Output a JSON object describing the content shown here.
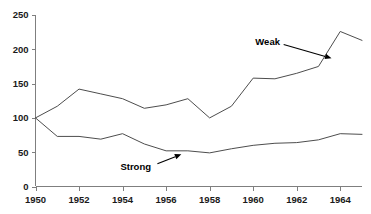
{
  "chart_data": {
    "type": "line",
    "title": "",
    "xlabel": "",
    "ylabel": "",
    "xlim": [
      1950,
      1965
    ],
    "ylim": [
      0,
      250
    ],
    "grid": false,
    "legend_position": "inline-annotations",
    "x": [
      1950,
      1951,
      1952,
      1953,
      1954,
      1955,
      1956,
      1957,
      1958,
      1959,
      1960,
      1961,
      1962,
      1963,
      1964,
      1965
    ],
    "xticks": [
      1950,
      1952,
      1954,
      1956,
      1958,
      1960,
      1962,
      1964
    ],
    "xtick_labels": [
      "1950",
      "1952",
      "1954",
      "1956",
      "1958",
      "1960",
      "1962",
      "1964"
    ],
    "yticks": [
      0,
      50,
      100,
      150,
      200,
      250
    ],
    "ytick_labels": [
      "0",
      "50",
      "100",
      "150",
      "200",
      "250"
    ],
    "series": [
      {
        "name": "Weak",
        "values": [
          100,
          117,
          142,
          135,
          128,
          114,
          119,
          128,
          100,
          117,
          158,
          157,
          165,
          175,
          226,
          213
        ]
      },
      {
        "name": "Strong",
        "values": [
          100,
          73,
          73,
          69,
          77,
          62,
          52,
          52,
          49,
          55,
          60,
          63,
          64,
          68,
          77,
          76
        ]
      }
    ],
    "annotations": [
      {
        "text": "Weak",
        "label_x": 1960.1,
        "label_y": 212,
        "arrow_from_x": 1961.4,
        "arrow_from_y": 207,
        "arrow_to_x": 1963.6,
        "arrow_to_y": 187
      },
      {
        "text": "Strong",
        "label_x": 1953.9,
        "label_y": 29,
        "arrow_from_x": 1955.6,
        "arrow_from_y": 33,
        "arrow_to_x": 1956.7,
        "arrow_to_y": 47
      }
    ]
  },
  "colors": {
    "line": "#4d4d4d",
    "axis": "#7f7f7f",
    "text": "#1a1a1a",
    "annotation": "#000000",
    "background": "#ffffff"
  }
}
